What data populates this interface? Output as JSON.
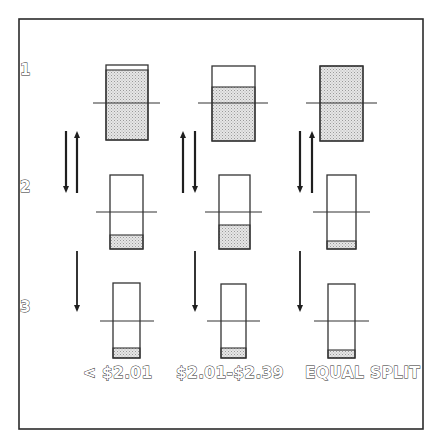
{
  "diagram": {
    "colors": {
      "frame": "#2b2b2b",
      "box_outline": "#333333",
      "fill_base": "#e6e6e6",
      "fill_dot": "#9a9a9a",
      "arrow": "#1f1f1f",
      "background": "#ffffff"
    },
    "frame": {
      "x": 19,
      "y": 19,
      "width": 404,
      "height": 410
    },
    "row_labels": [
      {
        "text": "1",
        "x": 20,
        "y": 75
      },
      {
        "text": "2",
        "x": 20,
        "y": 192
      },
      {
        "text": "3",
        "x": 20,
        "y": 312
      }
    ],
    "column_labels": [
      {
        "text": "< $2.01",
        "x": 83,
        "y": 378
      },
      {
        "text": "$2.01-$2.39",
        "x": 176,
        "y": 378
      },
      {
        "text": "EQUAL SPLIT",
        "x": 305,
        "y": 378
      }
    ],
    "boxes": [
      {
        "id": "c1-r1",
        "column": "< $2.01",
        "row": 1,
        "x": 106,
        "y": 65,
        "w": 42,
        "h": 75,
        "fill_top": 70,
        "line_y": 103,
        "line_x1": 93,
        "line_x2": 160
      },
      {
        "id": "c2-r1",
        "column": "$2.01-$2.39",
        "row": 1,
        "x": 212,
        "y": 66,
        "w": 43,
        "h": 75,
        "fill_top": 87,
        "line_y": 103,
        "line_x1": 198,
        "line_x2": 268
      },
      {
        "id": "c3-r1",
        "column": "EQUAL SPLIT",
        "row": 1,
        "x": 320,
        "y": 66,
        "w": 43,
        "h": 75,
        "fill_top": 66,
        "line_y": 103,
        "line_x1": 306,
        "line_x2": 377
      },
      {
        "id": "c1-r2",
        "column": "< $2.01",
        "row": 2,
        "x": 110,
        "y": 175,
        "w": 33,
        "h": 74,
        "fill_top": 235,
        "line_y": 212,
        "line_x1": 96,
        "line_x2": 157
      },
      {
        "id": "c2-r2",
        "column": "$2.01-$2.39",
        "row": 2,
        "x": 219,
        "y": 175,
        "w": 31,
        "h": 74,
        "fill_top": 225,
        "line_y": 212,
        "line_x1": 205,
        "line_x2": 262
      },
      {
        "id": "c3-r2",
        "column": "EQUAL SPLIT",
        "row": 2,
        "x": 327,
        "y": 175,
        "w": 29,
        "h": 74,
        "fill_top": 241,
        "line_y": 212,
        "line_x1": 313,
        "line_x2": 370
      },
      {
        "id": "c1-r3",
        "column": "< $2.01",
        "row": 3,
        "x": 113,
        "y": 283,
        "w": 27,
        "h": 75,
        "fill_top": 348,
        "line_y": 321,
        "line_x1": 100,
        "line_x2": 154
      },
      {
        "id": "c2-r3",
        "column": "$2.01-$2.39",
        "row": 3,
        "x": 221,
        "y": 284,
        "w": 25,
        "h": 74,
        "fill_top": 348,
        "line_y": 321,
        "line_x1": 207,
        "line_x2": 260
      },
      {
        "id": "c3-r3",
        "column": "EQUAL SPLIT",
        "row": 3,
        "x": 328,
        "y": 284,
        "w": 27,
        "h": 74,
        "fill_top": 350,
        "line_y": 321,
        "line_x1": 314,
        "line_x2": 369
      }
    ],
    "arrows": [
      {
        "id": "c1-r1r2-down",
        "direction": "down",
        "x": 66,
        "y1": 131,
        "y2": 193,
        "weight": "bold"
      },
      {
        "id": "c1-r1r2-up",
        "direction": "up",
        "x": 77,
        "y1": 131,
        "y2": 193,
        "weight": "bold"
      },
      {
        "id": "c1-r2r3-down",
        "direction": "down",
        "x": 77,
        "y1": 251,
        "y2": 312,
        "weight": "thin"
      },
      {
        "id": "c2-r1r2-up",
        "direction": "up",
        "x": 183,
        "y1": 131,
        "y2": 193,
        "weight": "bold"
      },
      {
        "id": "c2-r1r2-down",
        "direction": "down",
        "x": 195,
        "y1": 131,
        "y2": 193,
        "weight": "bold"
      },
      {
        "id": "c2-r2r3-down",
        "direction": "down",
        "x": 195,
        "y1": 251,
        "y2": 312,
        "weight": "thin"
      },
      {
        "id": "c3-r1r2-down",
        "direction": "down",
        "x": 300,
        "y1": 131,
        "y2": 193,
        "weight": "bold"
      },
      {
        "id": "c3-r1r2-up",
        "direction": "up",
        "x": 312,
        "y1": 131,
        "y2": 193,
        "weight": "bold"
      },
      {
        "id": "c3-r2r3-down",
        "direction": "down",
        "x": 300,
        "y1": 251,
        "y2": 312,
        "weight": "thin"
      }
    ]
  }
}
